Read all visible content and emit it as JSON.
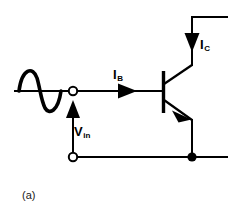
{
  "figure": {
    "caption": "(a)",
    "background_color": "#ffffff",
    "ink_color": "#000000",
    "width": 233,
    "height": 224
  },
  "labels": {
    "collector_current": {
      "symbol": "I",
      "subscript": "C",
      "full": "IC"
    },
    "base_current": {
      "symbol": "I",
      "subscript": "B",
      "full": "IB"
    },
    "input_voltage": {
      "symbol": "V",
      "subscript": "in",
      "full": "Vin"
    }
  },
  "components": {
    "ac_source": {
      "name": "sine-wave-source",
      "x_start": 14,
      "x_end": 66,
      "baseline_y": 91
    },
    "input_terminal": {
      "name": "open-circle-terminal",
      "cx": 73,
      "cy": 91,
      "r": 4.2,
      "filled": false
    },
    "ground_terminal": {
      "name": "open-circle-terminal",
      "cx": 73,
      "cy": 157,
      "r": 4.2,
      "filled": false
    },
    "junction_node": {
      "name": "filled-node-dot",
      "cx": 192,
      "cy": 157,
      "r": 4.6,
      "filled": true
    },
    "transistor": {
      "type": "npn",
      "base_bar_x": 163,
      "base_bar_y_top": 72,
      "base_bar_y_bottom": 112,
      "collector_x": 192,
      "emitter_x": 192
    },
    "base_current_arrow": {
      "direction": "right",
      "x": 118,
      "y": 91
    },
    "collector_current_arrow": {
      "direction": "down",
      "x": 192,
      "y": 36
    },
    "input_voltage_arrow": {
      "direction": "up",
      "x": 73,
      "y": 110
    }
  },
  "wires": {
    "base_wire": "horizontal from input terminal at x=77 to base bar at x=163, y=91",
    "collector_wire": "from base bar up-right to x=192, then up to y=17, then right to x=228",
    "emitter_wire": "from base bar down-right to x=192, then down to node at y=157",
    "bottom_rail": "horizontal from ground terminal x=77 to x=228 at y=157",
    "vin_rail": "vertical from ground terminal up to input terminal at x=73"
  }
}
